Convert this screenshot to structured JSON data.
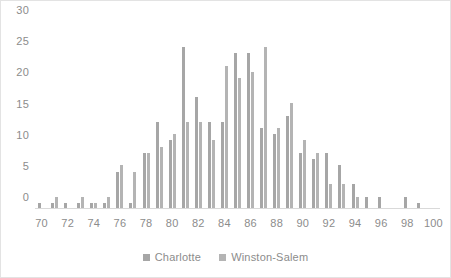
{
  "chart_data": {
    "type": "bar",
    "title": "",
    "subtitle": "",
    "xlabel": "",
    "ylabel": "",
    "ylim": [
      0,
      30
    ],
    "ytick_step": 5,
    "yticks": [
      "0",
      "5",
      "10",
      "15",
      "20",
      "25",
      "30"
    ],
    "grid": false,
    "legend_position": "bottom",
    "categories": [
      "70",
      "71",
      "72",
      "73",
      "74",
      "75",
      "76",
      "77",
      "78",
      "79",
      "80",
      "81",
      "82",
      "83",
      "84",
      "85",
      "86",
      "87",
      "88",
      "89",
      "90",
      "91",
      "92",
      "93",
      "94",
      "95",
      "96",
      "97",
      "98",
      "99",
      "100"
    ],
    "xtick_labels": [
      "70",
      "",
      "72",
      "",
      "74",
      "",
      "76",
      "",
      "78",
      "",
      "80",
      "",
      "82",
      "",
      "84",
      "",
      "86",
      "",
      "88",
      "",
      "90",
      "",
      "92",
      "",
      "94",
      "",
      "96",
      "",
      "98",
      "",
      "100"
    ],
    "series": [
      {
        "name": "Charlotte",
        "color": "#a6a6a6",
        "values": [
          1,
          1,
          1,
          1,
          1,
          1,
          6,
          1,
          9,
          14,
          11,
          26,
          18,
          14,
          14,
          25,
          25,
          13,
          12,
          15,
          9,
          8,
          9,
          7,
          4,
          2,
          2,
          0,
          2,
          1,
          0
        ]
      },
      {
        "name": "Winston-Salem",
        "color": "#b4b4b4",
        "values": [
          0,
          2,
          0,
          2,
          1,
          2,
          7,
          6,
          9,
          10,
          12,
          14,
          14,
          11,
          23,
          21,
          22,
          26,
          13,
          17,
          11,
          9,
          4,
          4,
          2,
          0,
          0,
          0,
          0,
          0,
          0
        ]
      }
    ]
  },
  "legend": {
    "items": [
      {
        "label": "Charlotte"
      },
      {
        "label": "Winston-Salem"
      }
    ]
  },
  "colors": {
    "series_charlotte": "#a6a6a6",
    "series_winston_salem": "#b4b4b4",
    "axis_text": "#8c8c8c",
    "baseline": "#d9d9d9",
    "frame_border": "#e3e3e3",
    "background": "#ffffff"
  }
}
